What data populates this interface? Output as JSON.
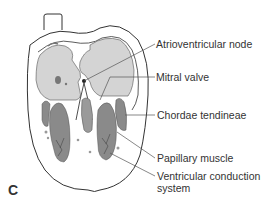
{
  "figure": {
    "panel_letter": "C",
    "labels": [
      {
        "id": "av-node",
        "text": "Atrioventricular node"
      },
      {
        "id": "mitral-valve",
        "text": "Mitral valve"
      },
      {
        "id": "chordae-tendineae",
        "text": "Chordae tendineae"
      },
      {
        "id": "papillary-muscle",
        "text": "Papillary muscle"
      },
      {
        "id": "ventricular-conduction-line1",
        "text": "Ventricular conduction"
      },
      {
        "id": "ventricular-conduction-line2",
        "text": "system"
      }
    ],
    "colors": {
      "outline": "#333333",
      "chamber_fill": "#d4d4d4",
      "muscle_fill": "#8a8a8a",
      "muscle_dark": "#6a6a6a",
      "wall_fill": "#ffffff",
      "leader_line": "#555555"
    }
  }
}
